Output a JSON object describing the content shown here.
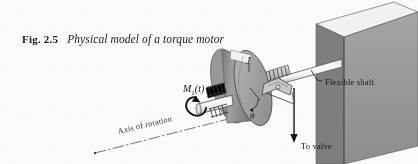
{
  "figure": {
    "caption_number": "Fig. 2.5",
    "caption_text": "Physical model of a torque motor",
    "background_color": "#fbfaf7",
    "ink_color": "#171614"
  },
  "labels": {
    "moment": "M",
    "moment_subscript": "1",
    "moment_argument": "(t)",
    "axis_of_rotation": "Axis of rotation",
    "flexible_shaft": "Flexible shaft",
    "to_valve": "To valve",
    "inertia": "J",
    "angle": "θ"
  },
  "components": {
    "wall": {
      "name": "Wall / support block",
      "face_color": "#9b9b9b",
      "top_color": "#f2f0ec",
      "side_color": "#6e6e6e"
    },
    "disk": {
      "name": "Rotor disk",
      "face_color": "#a9a7a3",
      "rim_color": "#8b8986",
      "highlight_color": "#efeeea"
    },
    "shaft": {
      "name": "Motor shaft",
      "color": "#f0efe9",
      "edge_color": "#53514e"
    },
    "flexible_shaft": {
      "name": "Flexible shaft",
      "color": "#f2f1ec",
      "edge_color": "#56544f"
    },
    "coil": {
      "name": "Coil winding",
      "color": "#4c4a47"
    },
    "bearing": {
      "name": "Bearing / linkage support",
      "color": "#c8c6c1"
    },
    "valve_rod": {
      "name": "Valve push rod",
      "color": "#3a3835"
    },
    "axis_line": {
      "name": "Axis of rotation centerline",
      "style": "dash-dot",
      "color": "#55534f"
    },
    "torque_arrow": {
      "name": "Applied torque arrow",
      "direction": "counterclockwise",
      "color": "#141312"
    }
  }
}
